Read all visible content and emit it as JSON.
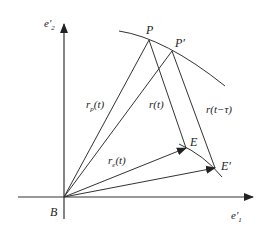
{
  "diagram": {
    "axes": {
      "x_label": "e′",
      "x_sub": "1",
      "y_label": "e′",
      "y_sub": "2",
      "origin_label": "B"
    },
    "points": {
      "P": "P",
      "P_prime": "P′",
      "E": "E",
      "E_prime": "E′"
    },
    "vectors": {
      "r_p": "r",
      "r_p_sub": "p",
      "r_p_arg": "(t)",
      "r_e": "r",
      "r_e_sub": "e",
      "r_e_arg": "(t)",
      "r_t": "r(t)",
      "r_t_tau": "r(t−τ)"
    },
    "colors": {
      "line": "#333333",
      "background": "#ffffff"
    }
  }
}
